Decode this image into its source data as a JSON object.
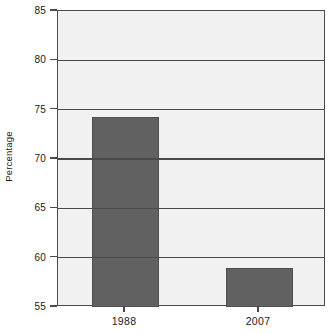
{
  "chart_data": {
    "type": "bar",
    "title": "",
    "xlabel": "",
    "ylabel": "Percentage",
    "categories": [
      "1988",
      "2007"
    ],
    "values": [
      74.3,
      59.0
    ],
    "ylim": [
      55,
      85
    ],
    "yticks": [
      55,
      60,
      65,
      70,
      75,
      80,
      85
    ],
    "ytick_labels": [
      "55",
      "60",
      "65",
      "70",
      "75",
      "80",
      "85"
    ],
    "grid": "horizontal",
    "legend": "none",
    "series": [
      {
        "name": "Percentage",
        "values": [
          74.3,
          59.0
        ]
      }
    ]
  },
  "style": {
    "bar_color": "#616161",
    "bar_border_color": "#4f4f4f",
    "plot_background": "#f1f1f1",
    "axis_color": "#4a4a4a",
    "gridline_color": "#4a4a4a",
    "text_color": "#1a1a1a",
    "page_background": "#ffffff"
  }
}
